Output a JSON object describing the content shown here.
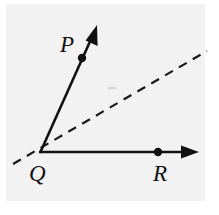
{
  "figure": {
    "canvas": {
      "width": 219,
      "height": 215
    },
    "background_color": "#f2f2f2",
    "page_color": "#ffffff",
    "stroke_color": "#111111",
    "paper_rect": {
      "x": 6,
      "y": 4,
      "width": 199,
      "height": 197
    },
    "labels": {
      "p": "P",
      "q": "Q",
      "r": "R"
    },
    "label_positions": {
      "p": {
        "x": 60,
        "y": 52
      },
      "q": {
        "x": 29,
        "y": 181
      },
      "r": {
        "x": 153,
        "y": 181
      }
    },
    "vertex": {
      "x": 40,
      "y": 152
    },
    "rays": [
      {
        "name": "ray-qp",
        "from": {
          "x": 40,
          "y": 152
        },
        "to": {
          "x": 93,
          "y": 34
        },
        "arrow_tip": {
          "x": 97,
          "y": 25
        },
        "style": "solid",
        "point_label": "P",
        "point_dot": {
          "x": 82,
          "y": 58,
          "r": 4.2
        }
      },
      {
        "name": "ray-qr",
        "from": {
          "x": 40,
          "y": 152
        },
        "to": {
          "x": 188,
          "y": 152
        },
        "arrow_tip": {
          "x": 199,
          "y": 152
        },
        "style": "solid",
        "point_label": "R",
        "point_dot": {
          "x": 158,
          "y": 152,
          "r": 4.2
        }
      }
    ],
    "dashed_line": {
      "name": "dashed-bisector",
      "from": {
        "x": 13,
        "y": 164
      },
      "to": {
        "x": 207,
        "y": 51
      },
      "style": "dashed",
      "dash_pattern": "9 7"
    },
    "smudge": {
      "x": 112,
      "y": 88,
      "width": 9,
      "height": 3
    }
  }
}
